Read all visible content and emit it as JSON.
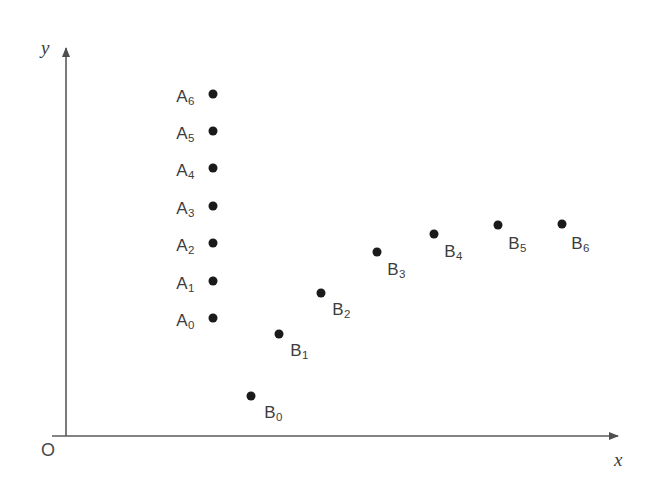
{
  "figure": {
    "background_color": "#ffffff",
    "point_color": "#1a1a1a",
    "axis_color": "#5a5a5a",
    "label_color": "#3d3d3d"
  },
  "axes": {
    "x_axis_label": "x",
    "y_axis_label": "y",
    "origin_label": "O",
    "x_axis_y_px": 436,
    "y_axis_x_px": 66,
    "x_axis_end_px": 628,
    "y_axis_top_px": 40
  },
  "chart_data": {
    "type": "scatter",
    "title": "",
    "xlabel": "x",
    "ylabel": "y",
    "grid": false,
    "legend": null,
    "axis_style": "arrows, no tick marks, no numeric scale",
    "origin_label": "O",
    "series": [
      {
        "name": "A",
        "description": "Seven points stacked in a single vertical column at constant x, evenly spaced in y",
        "point_labels": [
          "A0",
          "A1",
          "A2",
          "A3",
          "A4",
          "A5",
          "A6"
        ],
        "label_display": [
          "A₀",
          "A₁",
          "A₂",
          "A₃",
          "A₄",
          "A₅",
          "A₆"
        ],
        "label_base": [
          "A",
          "A",
          "A",
          "A",
          "A",
          "A",
          "A"
        ],
        "label_sub": [
          "0",
          "1",
          "2",
          "3",
          "4",
          "5",
          "6"
        ],
        "px": [
          {
            "x": 213,
            "y": 318
          },
          {
            "x": 213,
            "y": 281
          },
          {
            "x": 213,
            "y": 243
          },
          {
            "x": 213,
            "y": 206
          },
          {
            "x": 213,
            "y": 168
          },
          {
            "x": 213,
            "y": 131
          },
          {
            "x": 213,
            "y": 94
          }
        ],
        "label_px": [
          {
            "x": 185,
            "y": 320
          },
          {
            "x": 185,
            "y": 283
          },
          {
            "x": 185,
            "y": 245
          },
          {
            "x": 185,
            "y": 208
          },
          {
            "x": 185,
            "y": 170
          },
          {
            "x": 185,
            "y": 133
          },
          {
            "x": 185,
            "y": 96
          }
        ]
      },
      {
        "name": "B",
        "description": "Seven points forming a rising concave-down curve from lower left to upper right, flattening out",
        "point_labels": [
          "B0",
          "B1",
          "B2",
          "B3",
          "B4",
          "B5",
          "B6"
        ],
        "label_display": [
          "B₀",
          "B₁",
          "B₂",
          "B₃",
          "B₄",
          "B₅",
          "B₆"
        ],
        "label_base": [
          "B",
          "B",
          "B",
          "B",
          "B",
          "B",
          "B"
        ],
        "label_sub": [
          "0",
          "1",
          "2",
          "3",
          "4",
          "5",
          "6"
        ],
        "px": [
          {
            "x": 251,
            "y": 396
          },
          {
            "x": 279,
            "y": 334
          },
          {
            "x": 321,
            "y": 293
          },
          {
            "x": 377,
            "y": 252
          },
          {
            "x": 434,
            "y": 234
          },
          {
            "x": 498,
            "y": 225
          },
          {
            "x": 562,
            "y": 224
          }
        ],
        "label_px": [
          {
            "x": 273,
            "y": 412
          },
          {
            "x": 299,
            "y": 350
          },
          {
            "x": 341,
            "y": 309
          },
          {
            "x": 396,
            "y": 269
          },
          {
            "x": 453,
            "y": 251
          },
          {
            "x": 517,
            "y": 243
          },
          {
            "x": 580,
            "y": 243
          }
        ]
      }
    ]
  }
}
